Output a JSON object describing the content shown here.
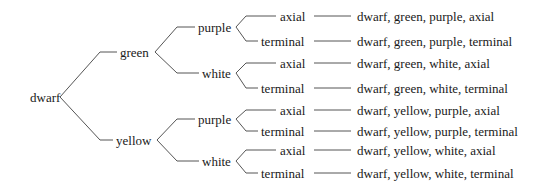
{
  "diagram": {
    "type": "tree",
    "root": {
      "label": "dwarf",
      "x": 30,
      "y": 97
    },
    "level1": [
      {
        "label": "green",
        "x": 120,
        "y": 52
      },
      {
        "label": "yellow",
        "x": 116,
        "y": 140
      }
    ],
    "level2": [
      {
        "label": "purple",
        "x": 198,
        "y": 27
      },
      {
        "label": "white",
        "x": 202,
        "y": 73
      },
      {
        "label": "purple",
        "x": 198,
        "y": 119
      },
      {
        "label": "white",
        "x": 202,
        "y": 161
      }
    ],
    "level3": [
      {
        "label": "axial",
        "x": 280,
        "y": 16
      },
      {
        "label": "terminal",
        "x": 261,
        "y": 41
      },
      {
        "label": "axial",
        "x": 280,
        "y": 63
      },
      {
        "label": "terminal",
        "x": 261,
        "y": 88
      },
      {
        "label": "axial",
        "x": 280,
        "y": 110
      },
      {
        "label": "terminal",
        "x": 261,
        "y": 131
      },
      {
        "label": "axial",
        "x": 280,
        "y": 150
      },
      {
        "label": "terminal",
        "x": 261,
        "y": 173
      }
    ],
    "outcomes": [
      {
        "label": "dwarf, green, purple, axial",
        "y": 16
      },
      {
        "label": "dwarf, green, purple, terminal",
        "y": 41
      },
      {
        "label": "dwarf, green, white, axial",
        "y": 63
      },
      {
        "label": "dwarf, green, white, terminal",
        "y": 88
      },
      {
        "label": "dwarf, yellow, purple, axial",
        "y": 110
      },
      {
        "label": "dwarf, yellow, purple, terminal",
        "y": 131
      },
      {
        "label": "dwarf, yellow, white, axial",
        "y": 150
      },
      {
        "label": "dwarf, yellow, white, terminal",
        "y": 173
      }
    ]
  }
}
